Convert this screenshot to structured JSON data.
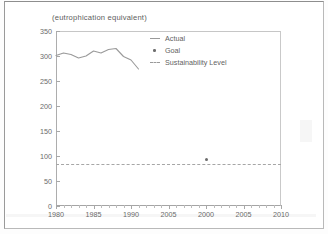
{
  "chart_data": {
    "type": "line",
    "title": "(eutrophication equivalent)",
    "xlabel": "",
    "ylabel": "",
    "xlim": [
      1980,
      2010
    ],
    "ylim": [
      0,
      350
    ],
    "grid": false,
    "legend_position": "top-center",
    "y_ticks": [
      0,
      50,
      100,
      150,
      200,
      250,
      300,
      350
    ],
    "y_tick_labels": [
      "0",
      "50",
      "100",
      "150",
      "200",
      "250",
      "300",
      "350"
    ],
    "x_ticks": [
      1980,
      1985,
      1990,
      1995,
      2000,
      2005,
      2010
    ],
    "x_tick_labels": [
      "1980",
      "1985",
      "1990",
      "2005",
      "2000",
      "2005",
      "2010"
    ],
    "legend": [
      "Actual",
      "Goal",
      "Sustainability Level"
    ],
    "series": [
      {
        "name": "Actual",
        "style": "line",
        "x": [
          1980,
          1981,
          1982,
          1983,
          1984,
          1985,
          1986,
          1987,
          1988,
          1989,
          1990,
          1991
        ],
        "values": [
          301,
          306,
          303,
          296,
          300,
          310,
          306,
          313,
          315,
          299,
          292,
          274
        ]
      },
      {
        "name": "Goal",
        "style": "point",
        "x": [
          2000
        ],
        "values": [
          94
        ]
      },
      {
        "name": "Sustainability Level",
        "style": "dashed-reference-line",
        "x": [
          1980,
          2010
        ],
        "values": [
          85,
          85
        ]
      }
    ]
  },
  "chart": {
    "title": "(eutrophication equivalent)",
    "legend": {
      "actual": "Actual",
      "goal": "Goal",
      "sustainability": "Sustainability Level"
    },
    "y_labels": [
      "350",
      "300",
      "250",
      "200",
      "150",
      "100",
      "50",
      "0"
    ],
    "x_labels": [
      "1980",
      "1985",
      "1990",
      "2005",
      "2000",
      "2005",
      "2010"
    ],
    "colors": {
      "line": "#9a9a9a",
      "text": "#5f5f5f",
      "axis": "#a8a8a8",
      "frame": "#b9b9b9"
    }
  }
}
